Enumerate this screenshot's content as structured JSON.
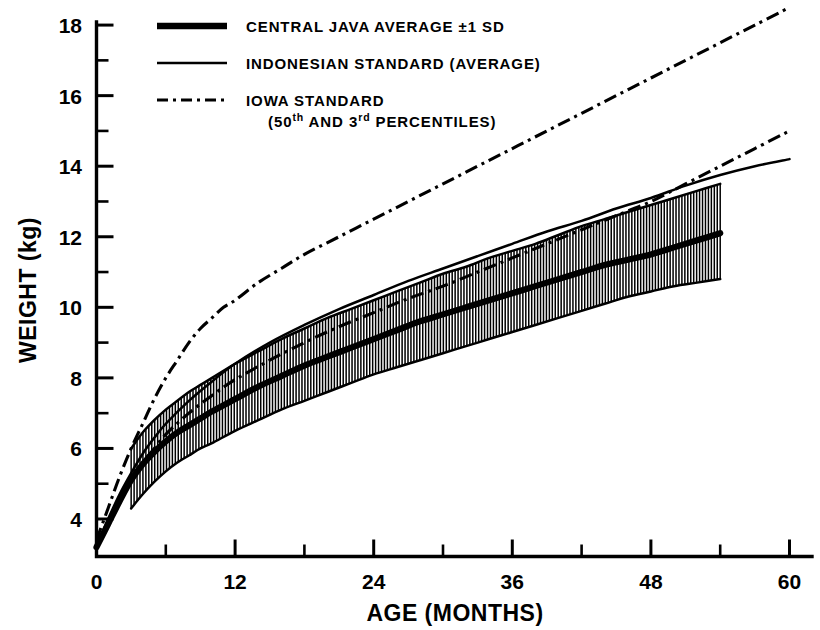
{
  "chart_data": {
    "type": "line",
    "title": "",
    "xlabel": "AGE (MONTHS)",
    "ylabel": "WEIGHT (kg)",
    "xlim": [
      0,
      62
    ],
    "ylim": [
      2.95,
      18.9
    ],
    "grid": false,
    "legend_position": "top-left",
    "x_ticks": [
      "0",
      "12",
      "24",
      "36",
      "48",
      "60"
    ],
    "x_tick_values": [
      0,
      12,
      24,
      36,
      48,
      60
    ],
    "x_minor_interval": 6,
    "y_ticks": [
      "4",
      "6",
      "8",
      "10",
      "12",
      "14",
      "16",
      "18"
    ],
    "y_tick_values": [
      4,
      6,
      8,
      10,
      12,
      14,
      16,
      18
    ],
    "y_minor_interval": 1,
    "series": [
      {
        "name": "CENTRAL JAVA AVERAGE ±1 SD",
        "style": "thick-solid",
        "x": [
          0,
          1,
          2,
          3,
          4,
          5,
          6,
          7,
          8,
          9,
          10,
          12,
          14,
          16,
          18,
          20,
          22,
          24,
          26,
          28,
          30,
          32,
          34,
          36,
          38,
          40,
          42,
          44,
          46,
          48,
          50,
          52,
          54
        ],
        "values": [
          3.2,
          3.85,
          4.5,
          5.1,
          5.55,
          5.9,
          6.2,
          6.45,
          6.65,
          6.85,
          7.05,
          7.4,
          7.75,
          8.05,
          8.35,
          8.6,
          8.85,
          9.1,
          9.35,
          9.6,
          9.8,
          10.0,
          10.2,
          10.4,
          10.6,
          10.8,
          11.0,
          11.2,
          11.35,
          11.5,
          11.7,
          11.9,
          12.1
        ]
      },
      {
        "name": "CENTRAL JAVA +1 SD",
        "style": "band-upper",
        "x": [
          3,
          4,
          5,
          6,
          7,
          8,
          9,
          10,
          12,
          14,
          16,
          18,
          20,
          22,
          24,
          26,
          28,
          30,
          32,
          34,
          36,
          38,
          40,
          42,
          44,
          46,
          48,
          50,
          52,
          54
        ],
        "values": [
          6.0,
          6.45,
          6.8,
          7.1,
          7.35,
          7.6,
          7.8,
          8.0,
          8.4,
          8.75,
          9.1,
          9.4,
          9.7,
          9.95,
          10.2,
          10.45,
          10.7,
          10.95,
          11.15,
          11.4,
          11.6,
          11.8,
          12.05,
          12.3,
          12.5,
          12.7,
          12.9,
          13.1,
          13.3,
          13.5
        ]
      },
      {
        "name": "CENTRAL JAVA -1 SD",
        "style": "band-lower",
        "x": [
          3,
          4,
          5,
          6,
          7,
          8,
          9,
          10,
          12,
          14,
          16,
          18,
          20,
          22,
          24,
          26,
          28,
          30,
          32,
          34,
          36,
          38,
          40,
          42,
          44,
          46,
          48,
          50,
          52,
          54
        ],
        "values": [
          4.3,
          4.7,
          5.05,
          5.35,
          5.6,
          5.8,
          6.0,
          6.15,
          6.5,
          6.8,
          7.1,
          7.35,
          7.6,
          7.85,
          8.1,
          8.3,
          8.5,
          8.7,
          8.9,
          9.1,
          9.3,
          9.5,
          9.7,
          9.9,
          10.1,
          10.3,
          10.45,
          10.6,
          10.7,
          10.8
        ]
      },
      {
        "name": "INDONESIAN STANDARD (AVERAGE)",
        "style": "thin-solid",
        "x": [
          0,
          1,
          2,
          3,
          4,
          5,
          6,
          8,
          10,
          12,
          15,
          18,
          21,
          24,
          27,
          30,
          33,
          36,
          39,
          42,
          45,
          48,
          51,
          54,
          57,
          60
        ],
        "values": [
          3.25,
          4.0,
          4.7,
          5.3,
          5.85,
          6.3,
          6.7,
          7.35,
          7.9,
          8.4,
          9.0,
          9.5,
          9.95,
          10.35,
          10.75,
          11.1,
          11.45,
          11.8,
          12.15,
          12.45,
          12.8,
          13.1,
          13.45,
          13.75,
          14.0,
          14.2
        ]
      },
      {
        "name": "IOWA STANDARD 50th PERCENTILE",
        "style": "dash-dot",
        "x": [
          0,
          1,
          2,
          3,
          4,
          5,
          6,
          7,
          8,
          9,
          10,
          11,
          12,
          14,
          16,
          18,
          21,
          24,
          27,
          30,
          33,
          36,
          39,
          42,
          45,
          48,
          51,
          54,
          57,
          60
        ],
        "values": [
          3.4,
          4.3,
          5.2,
          6.0,
          6.7,
          7.4,
          8.0,
          8.5,
          9.0,
          9.4,
          9.7,
          10.0,
          10.2,
          10.7,
          11.1,
          11.5,
          12.0,
          12.5,
          13.0,
          13.5,
          14.0,
          14.5,
          15.0,
          15.5,
          16.0,
          16.5,
          17.0,
          17.5,
          18.0,
          18.5
        ]
      },
      {
        "name": "IOWA STANDARD 3rd PERCENTILE",
        "style": "dash-dot",
        "x": [
          0,
          1,
          2,
          3,
          4,
          5,
          6,
          8,
          10,
          12,
          15,
          18,
          21,
          24,
          27,
          30,
          33,
          36,
          39,
          42,
          45,
          48,
          51,
          54,
          57,
          60
        ],
        "values": [
          3.2,
          3.8,
          4.5,
          5.1,
          5.6,
          6.0,
          6.4,
          7.0,
          7.5,
          7.95,
          8.5,
          9.0,
          9.45,
          9.85,
          10.25,
          10.6,
          11.0,
          11.4,
          11.8,
          12.2,
          12.6,
          13.0,
          13.5,
          14.0,
          14.5,
          15.0
        ]
      }
    ]
  },
  "legend": {
    "items": [
      {
        "label": "CENTRAL JAVA  AVERAGE ±1 SD",
        "sample": "thick-solid-line-icon"
      },
      {
        "label": "INDONESIAN STANDARD (AVERAGE)",
        "sample": "thin-solid-line-icon"
      },
      {
        "label": "IOWA STANDARD",
        "sample": "dash-dot-line-icon",
        "sublabel_pre": "(50",
        "sublabel_sup1": "th",
        "sublabel_mid": " AND 3",
        "sublabel_sup2": "rd",
        "sublabel_post": " PERCENTILES)"
      }
    ]
  },
  "axes": {
    "x_title": "AGE (MONTHS)",
    "y_title": "WEIGHT (kg)",
    "x_labels": [
      "0",
      "12",
      "24",
      "36",
      "48",
      "60"
    ],
    "y_labels": [
      "4",
      "6",
      "8",
      "10",
      "12",
      "14",
      "16",
      "18"
    ]
  }
}
